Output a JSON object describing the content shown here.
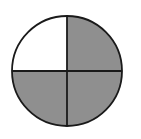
{
  "diagram": {
    "type": "fraction-circle",
    "total_parts": 4,
    "shaded_parts": 3,
    "shaded_quadrants": [
      "top-right",
      "bottom-left",
      "bottom-right"
    ],
    "unshaded_quadrants": [
      "top-left"
    ],
    "colors": {
      "shaded": "#8f8f8f",
      "unshaded": "#ffffff",
      "stroke": "#1a1a1a"
    }
  }
}
